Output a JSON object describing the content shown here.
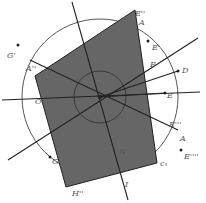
{
  "diagram": {
    "type": "geometry-construction",
    "colors": {
      "background": "#ffffff",
      "polygon_fill": "#666666",
      "stroke": "#222222",
      "circle": "#555555",
      "label": "#555555"
    },
    "center": {
      "x": 100,
      "y": 97
    },
    "outer_circle": {
      "cx": 100,
      "cy": 97,
      "r": 78,
      "label": "c1"
    },
    "inner_circle": {
      "cx": 100,
      "cy": 97,
      "r": 26
    },
    "polygon": {
      "points": "135,10 157,163 66,187 35,76",
      "vertices": [
        "E'' top",
        "E''' right",
        "H''",
        "A''"
      ]
    },
    "lines": [
      {
        "x1": 72,
        "y1": 2,
        "x2": 128,
        "y2": 200
      },
      {
        "x1": 2,
        "y1": 100,
        "x2": 200,
        "y2": 92
      },
      {
        "x1": 8,
        "y1": 160,
        "x2": 198,
        "y2": 38
      },
      {
        "x1": 30,
        "y1": 60,
        "x2": 178,
        "y2": 130
      },
      {
        "x1": 100,
        "y1": 97,
        "x2": 178,
        "y2": 71
      },
      {
        "x1": 100,
        "y1": 97,
        "x2": 165,
        "y2": 93
      }
    ],
    "points": [
      {
        "name": "G'",
        "x": 18,
        "y": 45,
        "filled": true
      },
      {
        "name": "E'",
        "x": 148,
        "y": 41,
        "filled": true
      },
      {
        "name": "E''''",
        "x": 181,
        "y": 150,
        "filled": true
      },
      {
        "name": "O_dot",
        "x": 50,
        "y": 157,
        "filled": true
      },
      {
        "name": "D",
        "x": 178,
        "y": 71,
        "filled": true
      },
      {
        "name": "E",
        "x": 165,
        "y": 93,
        "filled": true
      }
    ],
    "labels": [
      {
        "text": "G'",
        "x": 7,
        "y": 58
      },
      {
        "text": "A''",
        "x": 26,
        "y": 71
      },
      {
        "text": "E''",
        "x": 135,
        "y": 16
      },
      {
        "text": "A",
        "x": 139,
        "y": 25
      },
      {
        "text": "E'",
        "x": 152,
        "y": 50
      },
      {
        "text": "F",
        "x": 150,
        "y": 67
      },
      {
        "text": "D",
        "x": 182,
        "y": 73
      },
      {
        "text": "E",
        "x": 167,
        "y": 98
      },
      {
        "text": "O",
        "x": 35,
        "y": 104
      },
      {
        "text": "E'''",
        "x": 169,
        "y": 127
      },
      {
        "text": "A",
        "x": 180,
        "y": 141
      },
      {
        "text": "E''''",
        "x": 184,
        "y": 159
      },
      {
        "text": "c1",
        "x": 160,
        "y": 166
      },
      {
        "text": "G",
        "x": 52,
        "y": 164
      },
      {
        "text": "N",
        "x": 119,
        "y": 154
      },
      {
        "text": "I",
        "x": 125,
        "y": 187
      },
      {
        "text": "H''",
        "x": 72,
        "y": 196
      }
    ]
  }
}
